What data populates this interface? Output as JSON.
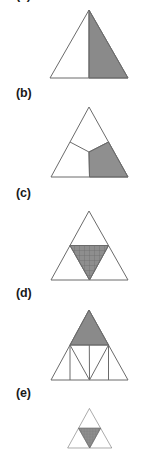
{
  "page": {
    "kind": "geometry-figure-sheet",
    "background_color": "#ffffff",
    "width": 166,
    "height": 452
  },
  "style": {
    "stroke_color": "#6b6b6b",
    "stroke_width": 1,
    "shade_fill": "#8a8a8a",
    "shade_fill_light": "#9a9a9a",
    "hatch_color": "#6f6f6f",
    "label_color": "#1a1a1a",
    "label_font_size": "12.5px"
  },
  "parts": [
    {
      "id": "a",
      "label": "(a)",
      "label_visible": false,
      "label_clipped_at_top": true,
      "caption": "Triangle split by an altitude from the apex to the base midpoint; the right half is shaded.",
      "fraction_shaded": "1/2",
      "apex": [
        89,
        10
      ],
      "base_left": [
        50,
        78
      ],
      "base_right": [
        128,
        78
      ],
      "shaded_regions": [
        "right-half"
      ],
      "divider_lines": [
        "apex-to-base-midpoint"
      ]
    },
    {
      "id": "b",
      "label": "(b)",
      "caption": "Triangle split into three regions by segments from an interior point to the base-left, to the midpoint of the left side and to the midpoint of the right side; the lower-right region is shaded.",
      "fraction_shaded": "1/3",
      "apex": [
        89,
        107
      ],
      "base_left": [
        51,
        177
      ],
      "base_right": [
        128,
        177
      ],
      "interior_point": [
        89,
        152
      ],
      "shaded_regions": [
        "lower-right"
      ],
      "divider_lines": [
        "interior-point-to-left-side-midpoint",
        "interior-point-to-right-side-midpoint",
        "interior-point-to-base-midpoint"
      ]
    },
    {
      "id": "c",
      "label": "(c)",
      "caption": "Triangle with its medial (inverted middle) triangle drawn and shaded with a crosshatch pattern.",
      "fraction_shaded": "1/4",
      "apex": [
        89,
        211
      ],
      "base_left": [
        51,
        280
      ],
      "base_right": [
        128,
        280
      ],
      "shaded_regions": [
        "medial-inverted-triangle"
      ],
      "divider_lines": [
        "midsegment-left",
        "midsegment-right",
        "midsegment-base"
      ],
      "hatched": true
    },
    {
      "id": "d",
      "label": "(d)",
      "caption": "Triangle subdivided into four medial triangles, with three extra vertical segments dropped to the base; the top medial triangle is shaded.",
      "fraction_shaded": "1/4",
      "apex": [
        89,
        310
      ],
      "base_left": [
        51,
        380
      ],
      "base_right": [
        128,
        380
      ],
      "shaded_regions": [
        "top-medial-triangle"
      ],
      "divider_lines": [
        "midsegment-left",
        "midsegment-right",
        "midsegment-horizontal",
        "vertical-left",
        "vertical-center",
        "vertical-right"
      ]
    },
    {
      "id": "e",
      "label": "(e)",
      "caption": "Triangle with its medial inverted triangle shaded; the figure is cropped by the bottom edge of the image.",
      "fraction_shaded": "1/4",
      "apex": [
        89,
        411
      ],
      "base_left": [
        51,
        481
      ],
      "base_right": [
        128,
        481
      ],
      "shaded_regions": [
        "medial-inverted-triangle"
      ],
      "divider_lines": [
        "midsegment-left",
        "midsegment-right",
        "midsegment-base"
      ],
      "clipped_at_bottom": true
    }
  ]
}
